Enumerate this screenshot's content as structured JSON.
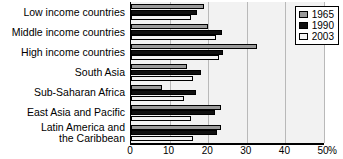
{
  "chart_data": {
    "type": "bar",
    "orientation": "horizontal",
    "title": "",
    "xlabel": "%",
    "ylabel": "",
    "xlim": [
      0,
      50
    ],
    "xticks": [
      0,
      10,
      20,
      30,
      40,
      50
    ],
    "xtick_labels": [
      "0",
      "10",
      "20",
      "30",
      "40",
      "50"
    ],
    "axis_unit": "%",
    "grid": true,
    "legend_position": "top-right",
    "categories": [
      "Low income countries",
      "Middle income countries",
      "High income countries",
      "South Asia",
      "Sub-Saharan Africa",
      "East Asia and Pacific",
      "Latin America and the Caribbean"
    ],
    "category_lines": [
      [
        "Low income countries"
      ],
      [
        "Middle income countries"
      ],
      [
        "High income countries"
      ],
      [
        "South Asia"
      ],
      [
        "Sub-Saharan Africa"
      ],
      [
        "East Asia and Pacific"
      ],
      [
        "Latin America and",
        "the Caribbean"
      ]
    ],
    "series": [
      {
        "name": "1965",
        "color": "#9a9a9a",
        "values": [
          19.0,
          20.0,
          32.7,
          14.5,
          8.1,
          23.3,
          23.3
        ]
      },
      {
        "name": "1990",
        "color": "#101010",
        "values": [
          17.2,
          23.7,
          23.9,
          18.1,
          16.8,
          21.8,
          22.2
        ]
      },
      {
        "name": "2003",
        "color": "#f4f4f4",
        "values": [
          15.5,
          22.0,
          22.7,
          16.0,
          13.8,
          15.5,
          16.0
        ]
      }
    ]
  },
  "legend": {
    "items": [
      {
        "label": "1965"
      },
      {
        "label": "1990"
      },
      {
        "label": "2003"
      }
    ]
  }
}
